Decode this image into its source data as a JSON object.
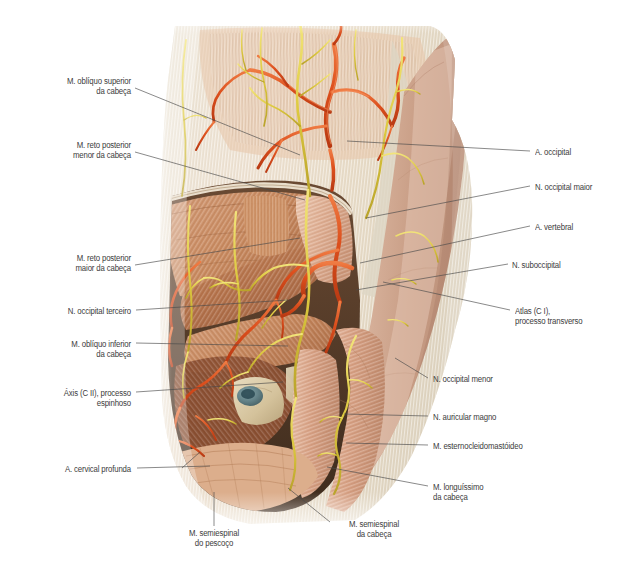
{
  "figure": {
    "background_color": "#ffffff",
    "palette": {
      "artery": "#d9481c",
      "artery_light": "#ec7344",
      "nerve": "#e3d24a",
      "nerve_dark": "#b9a62c",
      "muscle_deep": "#b5724a",
      "muscle_light": "#d49c78",
      "muscle_pale": "#e2b79a",
      "aponeurosis": "#e8e2d4",
      "skin_flap": "#cda68f",
      "bone": "#ddd0b0",
      "cartilage": "#6f8f96",
      "leader_line": "#4a4a4a",
      "label_text": "#3c3c3c"
    }
  },
  "labels_left": [
    {
      "id": "m-obliquo-superior-da-cabeca",
      "text": "M. oblíquo superior\nda cabeça",
      "x": 28,
      "y": 76,
      "w": 103,
      "leader": [
        [
          135,
          88
        ],
        [
          300,
          155
        ]
      ]
    },
    {
      "id": "m-reto-posterior-menor-da-cabeca",
      "text": "M. reto posterior\nmenor da cabeça",
      "x": 36,
      "y": 140,
      "w": 95,
      "leader": [
        [
          135,
          152
        ],
        [
          305,
          200
        ]
      ]
    },
    {
      "id": "m-reto-posterior-maior-da-cabeca",
      "text": "M. reto posterior\nmaior da cabeça",
      "x": 40,
      "y": 253,
      "w": 91,
      "leader": [
        [
          135,
          265
        ],
        [
          300,
          238
        ]
      ]
    },
    {
      "id": "n-occipital-terceiro",
      "text": "N. occipital terceiro",
      "x": 33,
      "y": 306,
      "w": 98,
      "leader": [
        [
          136,
          310
        ],
        [
          288,
          300
        ]
      ]
    },
    {
      "id": "m-obliquo-inferior-da-cabeca",
      "text": "M. oblíquo inferior\nda cabeça",
      "x": 38,
      "y": 339,
      "w": 93,
      "leader": [
        [
          136,
          343
        ],
        [
          288,
          346
        ]
      ]
    },
    {
      "id": "axis-cii-processo-espinhoso",
      "text": "Áxis (C II), processo\nespinhoso",
      "x": 33,
      "y": 388,
      "w": 98,
      "leader": [
        [
          136,
          392
        ],
        [
          283,
          382
        ]
      ]
    },
    {
      "id": "a-cervical-profunda",
      "text": "A. cervical profunda",
      "x": 28,
      "y": 464,
      "w": 103,
      "leader": [
        [
          137,
          468
        ],
        [
          210,
          466
        ]
      ],
      "leader2": [
        [
          182,
          468
        ],
        [
          200,
          452
        ]
      ]
    }
  ],
  "labels_right": [
    {
      "id": "a-occipital",
      "text": "A. occipital",
      "x": 535,
      "y": 147,
      "w": 90,
      "leader": [
        [
          530,
          151
        ],
        [
          347,
          141
        ]
      ]
    },
    {
      "id": "n-occipital-maior",
      "text": "N. occipital maior",
      "x": 535,
      "y": 182,
      "w": 90,
      "leader": [
        [
          530,
          186
        ],
        [
          366,
          218
        ]
      ]
    },
    {
      "id": "a-vertebral",
      "text": "A. vertebral",
      "x": 535,
      "y": 222,
      "w": 90,
      "leader": [
        [
          530,
          226
        ],
        [
          360,
          263
        ]
      ]
    },
    {
      "id": "n-suboccipital",
      "text": "N. suboccipital",
      "x": 512,
      "y": 260,
      "w": 113,
      "leader": [
        [
          508,
          264
        ],
        [
          356,
          290
        ]
      ]
    },
    {
      "id": "atlas-ci-processo-transverso",
      "text": "Atlas (C I),\nprocesso transverso",
      "x": 515,
      "y": 306,
      "w": 110,
      "leader": [
        [
          510,
          310
        ],
        [
          383,
          282
        ]
      ]
    },
    {
      "id": "n-occipital-menor",
      "text": "N. occipital menor",
      "x": 433,
      "y": 374,
      "w": 115,
      "leader": [
        [
          428,
          378
        ],
        [
          395,
          358
        ]
      ]
    },
    {
      "id": "n-auricular-magno",
      "text": "N. auricular magno",
      "x": 433,
      "y": 412,
      "w": 118,
      "leader": [
        [
          428,
          416
        ],
        [
          344,
          414
        ]
      ]
    },
    {
      "id": "m-esternocleidomastoideo",
      "text": "M. esternocleidomastóideo",
      "x": 433,
      "y": 441,
      "w": 160,
      "leader": [
        [
          428,
          445
        ],
        [
          346,
          443
        ]
      ]
    },
    {
      "id": "m-longuissimo-da-cabeca",
      "text": "M. longuíssimo\nda cabeça",
      "x": 433,
      "y": 482,
      "w": 90,
      "leader": [
        [
          428,
          486
        ],
        [
          327,
          467
        ]
      ]
    }
  ],
  "labels_bottom": [
    {
      "id": "m-semiespinal-do-pescoco",
      "text": "M. semiespinal\ndo pescoço",
      "x": 172,
      "y": 528,
      "w": 84,
      "leader": [
        [
          214,
          526
        ],
        [
          214,
          492
        ]
      ]
    },
    {
      "id": "m-semiespinal-da-cabeca",
      "text": "M. semiespinal\nda cabeça",
      "x": 332,
      "y": 519,
      "w": 84,
      "leader": [
        [
          330,
          522
        ],
        [
          288,
          488
        ]
      ]
    }
  ],
  "structures": [
    {
      "name": "scalp-aponeurosis",
      "type": "tissue",
      "label": "Gálea aponeurótica / epicrânio"
    },
    {
      "name": "occipital-artery-branches",
      "type": "artery",
      "label": "Ramos da a. occipital"
    },
    {
      "name": "greater-occipital-nerve",
      "type": "nerve",
      "label": "N. occipital maior"
    },
    {
      "name": "suboccipital-triangle",
      "type": "muscle-group",
      "label": "Triângulo suboccipital"
    },
    {
      "name": "reflected-skin-flap",
      "type": "skin",
      "label": "Retalho cutâneo rebatido"
    },
    {
      "name": "sternocleidomastoid",
      "type": "muscle",
      "label": "M. esternocleidomastóideo"
    },
    {
      "name": "vertebral-artery-loop",
      "type": "artery",
      "label": "Alça da a. vertebral"
    },
    {
      "name": "semispinalis-capitis",
      "type": "muscle",
      "label": "M. semiespinal da cabeça"
    }
  ]
}
